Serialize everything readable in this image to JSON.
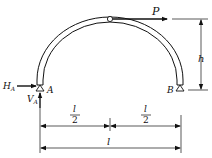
{
  "diagram": {
    "type": "three-hinged semicircular arch",
    "labels": {
      "load": "P",
      "height": "h",
      "support_a": "A",
      "support_b": "B",
      "reaction_h": "H",
      "reaction_h_sub": "A",
      "reaction_v": "V",
      "reaction_v_sub": "A",
      "half_span_left_num": "l",
      "half_span_left_den": "2",
      "half_span_right_num": "l",
      "half_span_right_den": "2",
      "span": "l"
    },
    "colors": {
      "stroke": "#111111",
      "background": "#ffffff"
    }
  }
}
